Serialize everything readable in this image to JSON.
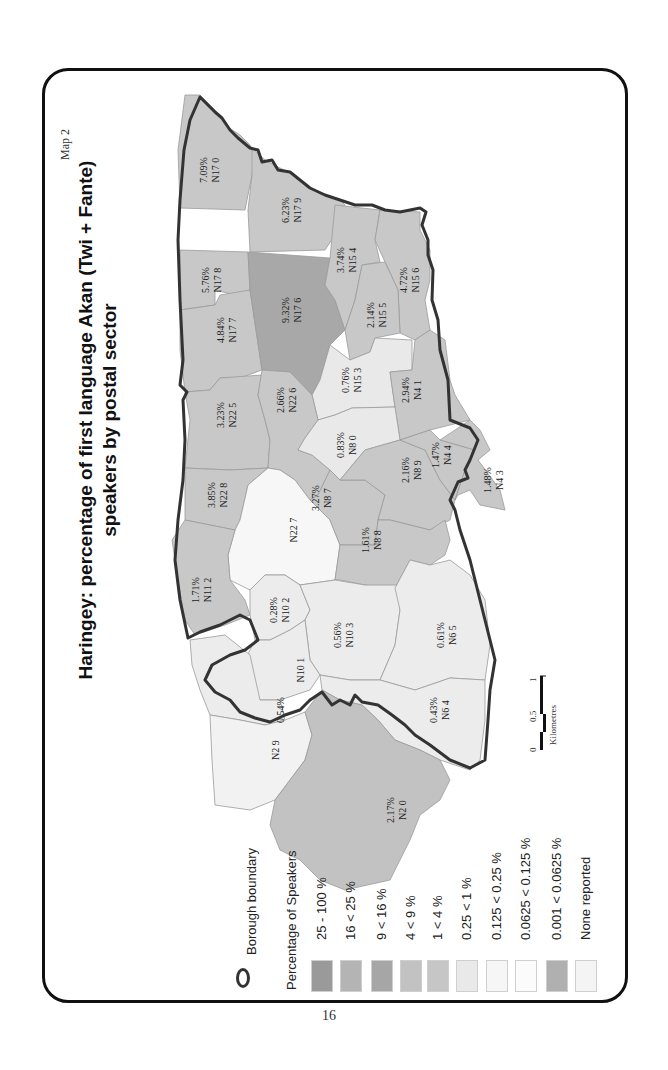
{
  "page": {
    "map_number": "Map 2",
    "page_number": "16",
    "title_line1": "Haringey: percentage of first language  Akan (Twi + Fante)",
    "title_line2": "speakers by postal sector"
  },
  "legend": {
    "boundary_label": "Borough boundary",
    "heading": "Percentage of Speakers",
    "classes": [
      {
        "label": "25 - 100 %",
        "color": "#9a9a9a"
      },
      {
        "label": "16 < 25 %",
        "color": "#b4b4b4"
      },
      {
        "label": "9 < 16 %",
        "color": "#a6a6a6"
      },
      {
        "label": "4 < 9 %",
        "color": "#c2c2c2"
      },
      {
        "label": "1 < 4 %",
        "color": "#c6c6c6"
      },
      {
        "label": "0.25 < 1 %",
        "color": "#e9e9e9"
      },
      {
        "label": "0.125 < 0.25 %",
        "color": "#f6f6f6"
      },
      {
        "label": "0.0625 < 0.125 %",
        "color": "#fbfbfb"
      },
      {
        "label": "0.001 < 0.0625 %",
        "color": "#b0b0b0"
      },
      {
        "label": "None reported",
        "color": "#f4f4f4"
      }
    ]
  },
  "scale_bar": {
    "ticks": [
      "0",
      "0.5",
      "1"
    ],
    "unit": "Kilometres"
  },
  "regions": [
    {
      "sector": "N17 0",
      "value": "7.09%"
    },
    {
      "sector": "N17 9",
      "value": "6.23%"
    },
    {
      "sector": "N17 8",
      "value": "5.76%"
    },
    {
      "sector": "N17 6",
      "value": "9.32%"
    },
    {
      "sector": "N17 7",
      "value": "4.84%"
    },
    {
      "sector": "N15 4",
      "value": "3.74%"
    },
    {
      "sector": "N15 5",
      "value": "2.14%"
    },
    {
      "sector": "N15 6",
      "value": "4.72%"
    },
    {
      "sector": "N22 5",
      "value": "3.23%"
    },
    {
      "sector": "N22 6",
      "value": "2.66%"
    },
    {
      "sector": "N15 3",
      "value": "0.76%"
    },
    {
      "sector": "N4 1",
      "value": "2.94%"
    },
    {
      "sector": "N8 0",
      "value": "0.83%"
    },
    {
      "sector": "N22 8",
      "value": "3.85%"
    },
    {
      "sector": "N22 7",
      "value": ""
    },
    {
      "sector": "N8 7",
      "value": "3.27%"
    },
    {
      "sector": "N8 9",
      "value": "2.16%"
    },
    {
      "sector": "N4 4",
      "value": "1.47%"
    },
    {
      "sector": "N4 3",
      "value": "1.48%"
    },
    {
      "sector": "N8 8",
      "value": "1.61%"
    },
    {
      "sector": "N11 2",
      "value": "1.71%"
    },
    {
      "sector": "N10 2",
      "value": "0.28%"
    },
    {
      "sector": "N10 3",
      "value": "0.56%"
    },
    {
      "sector": "N6 5",
      "value": "0.61%"
    },
    {
      "sector": "N10 1",
      "value": ""
    },
    {
      "sector": "",
      "value": "0.54%"
    },
    {
      "sector": "N6 4",
      "value": "0.43%"
    },
    {
      "sector": "N2 9",
      "value": ""
    },
    {
      "sector": "N2 0",
      "value": "2.17%"
    }
  ]
}
